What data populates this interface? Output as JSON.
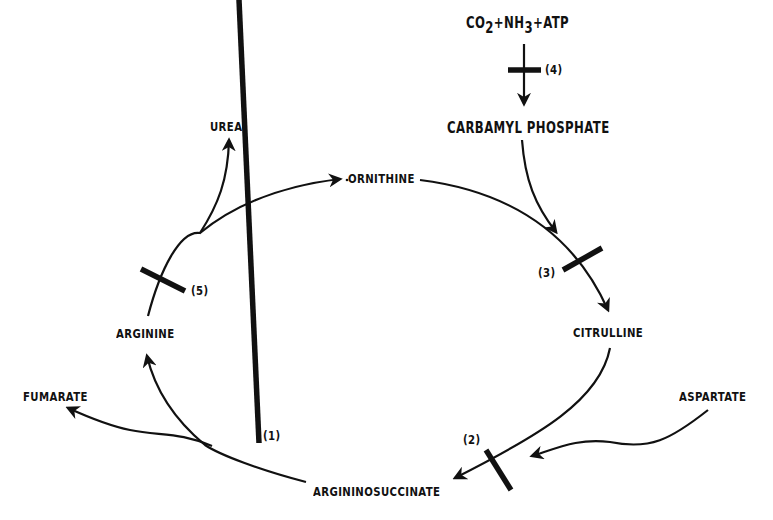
{
  "diagram": {
    "type": "metabolic-cycle",
    "inputs": {
      "reactants_prefix": "CO",
      "reactants_sub1": "2",
      "reactants_mid": "+NH",
      "reactants_sub2": "3",
      "reactants_suffix": "+ATP"
    },
    "nodes": {
      "carbamyl_phosphate": "CARBAMYL PHOSPHATE",
      "ornithine": "ORNITHINE",
      "urea": "UREA",
      "citrulline": "CITRULLINE",
      "aspartate": "ASPARTATE",
      "argininosuccinate": "ARGININOSUCCINATE",
      "arginine": "ARGININE",
      "fumarate": "FUMARATE"
    },
    "blocks": {
      "b1": "(1)",
      "b2": "(2)",
      "b3": "(3)",
      "b4": "(4)",
      "b5": "(5)"
    },
    "edges": [
      {
        "from": "CO2+NH3+ATP",
        "to": "CARBAMYL PHOSPHATE",
        "block": "(4)"
      },
      {
        "from": "CARBAMYL PHOSPHATE",
        "to": "CITRULLINE",
        "joins": "ORNITHINE",
        "block": "(3)"
      },
      {
        "from": "ORNITHINE",
        "to": "CITRULLINE",
        "block": "(3)"
      },
      {
        "from": "CITRULLINE",
        "to": "ARGININOSUCCINATE",
        "joins": "ASPARTATE",
        "block": "(2)"
      },
      {
        "from": "ARGININOSUCCINATE",
        "to": "ARGININE",
        "side_product": "FUMARATE",
        "block": "(1)"
      },
      {
        "from": "ARGININE",
        "to": "ORNITHINE",
        "side_product": "UREA",
        "block": "(5)"
      }
    ],
    "colors": {
      "ink": "#111111",
      "background": "#ffffff"
    }
  }
}
